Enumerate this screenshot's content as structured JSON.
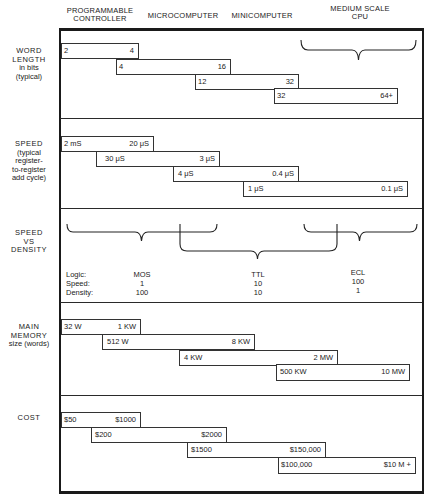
{
  "columns": [
    {
      "label_line1": "PROGRAMMABLE",
      "label_line2": "CONTROLLER"
    },
    {
      "label_line1": "MICROCOMPUTER",
      "label_line2": ""
    },
    {
      "label_line1": "MINICOMPUTER",
      "label_line2": ""
    },
    {
      "label_line1": "MEDIUM SCALE",
      "label_line2": "CPU"
    }
  ],
  "rows": {
    "word_length": {
      "label": [
        "WORD",
        "LENGTH",
        "in bits",
        "(typical)"
      ],
      "bars": [
        {
          "low": "2",
          "high": "4"
        },
        {
          "low": "4",
          "high": "16"
        },
        {
          "low": "12",
          "high": "32"
        },
        {
          "low": "32",
          "high": "64+"
        }
      ]
    },
    "speed": {
      "label": [
        "SPEED",
        "(typical",
        "register-",
        "to-register",
        "add cycle)"
      ],
      "bars": [
        {
          "low": "2 mS",
          "high": "20 μS"
        },
        {
          "low": "30 μS",
          "high": "3 μS"
        },
        {
          "low": "4 μS",
          "high": "0.4 μS"
        },
        {
          "low": "1 μS",
          "high": "0.1 μS"
        }
      ]
    },
    "speed_vs_density": {
      "label": [
        "SPEED",
        "VS",
        "DENSITY"
      ],
      "row_labels": [
        "Logic:",
        "Speed:",
        "Density:"
      ],
      "technologies": [
        {
          "logic": "MOS",
          "speed": "1",
          "density": "100"
        },
        {
          "logic": "TTL",
          "speed": "10",
          "density": "10"
        },
        {
          "logic": "ECL",
          "speed": "100",
          "density": "1"
        }
      ]
    },
    "main_memory": {
      "label": [
        "MAIN",
        "MEMORY",
        "size (words)"
      ],
      "bars": [
        {
          "low": "32 W",
          "high": "1 KW"
        },
        {
          "low": "512 W",
          "high": "8 KW"
        },
        {
          "low": "4 KW",
          "high": "2 MW"
        },
        {
          "low": "500 KW",
          "high": "10 MW"
        }
      ]
    },
    "cost": {
      "label": [
        "COST"
      ],
      "bars": [
        {
          "low": "$50",
          "high": "$1000"
        },
        {
          "low": "$200",
          "high": "$2000"
        },
        {
          "low": "$1500",
          "high": "$150,000"
        },
        {
          "low": "$100,000",
          "high": "$10 M +"
        }
      ]
    }
  }
}
